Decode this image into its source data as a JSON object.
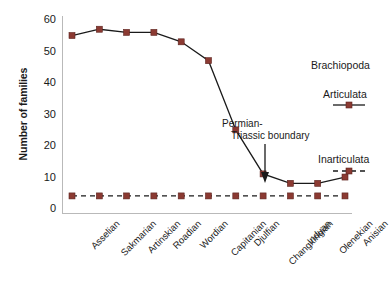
{
  "chart_data": {
    "type": "line",
    "title": "",
    "xlabel": "",
    "ylabel": "Number of families",
    "ylim": [
      0,
      62
    ],
    "yticks": [
      0,
      10,
      20,
      30,
      40,
      50,
      60
    ],
    "grid": false,
    "legend_position": "right",
    "legend_title": "Brachiopoda",
    "categories": [
      "Asselian",
      "Sakmarian",
      "Artinskian",
      "Roadian",
      "Wordian",
      "Capitanian",
      "Djulfian",
      "Changxingian",
      "Induan",
      "Olenekian",
      "Anisian"
    ],
    "series": [
      {
        "name": "Articulata",
        "linestyle": "solid",
        "marker": "square",
        "color": "#8B3A32",
        "line_color": "#1a1a1a",
        "values": [
          55,
          57,
          56,
          56,
          53,
          47,
          25,
          11,
          8,
          8,
          10
        ]
      },
      {
        "name": "Inarticulata",
        "linestyle": "dashed",
        "marker": "square",
        "color": "#8B3A32",
        "line_color": "#1a1a1a",
        "values": [
          4,
          4,
          4,
          4,
          4,
          4,
          4,
          4,
          4,
          4,
          4
        ]
      }
    ],
    "annotations": [
      {
        "name": "permian-triassic-boundary",
        "line_1": "Permian-",
        "line_2": "Triassic boundary",
        "arrow": "down"
      }
    ]
  }
}
